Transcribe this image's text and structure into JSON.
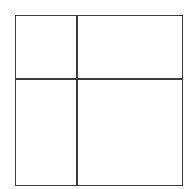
{
  "diagram": {
    "type": "grid-partition",
    "frame": {
      "left": 15,
      "top": 15,
      "right": 183,
      "bottom": 186
    },
    "vertical_divider_x": 76,
    "horizontal_divider_y": 78,
    "line_color": "#3a3a3a",
    "background_color": "#ffffff",
    "regions": [
      {
        "name": "top-left"
      },
      {
        "name": "top-right"
      },
      {
        "name": "bottom-left"
      },
      {
        "name": "bottom-right"
      }
    ]
  }
}
